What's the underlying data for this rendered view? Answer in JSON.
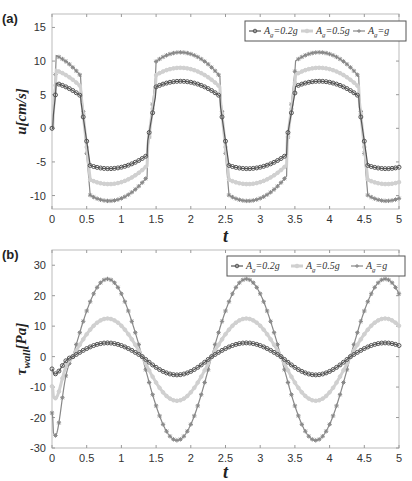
{
  "chart_data": [
    {
      "panel_label": "(a)",
      "type": "line",
      "title": "",
      "xlabel": "t",
      "ylabel": "u[cm/s]",
      "xlim": [
        0,
        5
      ],
      "ylim": [
        -12,
        17
      ],
      "xticks": [
        "0",
        "0.5",
        "1",
        "1.5",
        "2",
        "2.5",
        "3",
        "3.5",
        "4",
        "4.5",
        "5"
      ],
      "yticks": [
        "-10",
        "-5",
        "0",
        "5",
        "10",
        "15"
      ],
      "grid": false,
      "legend_position": "top-right",
      "series": [
        {
          "name": "A_g=0.2g",
          "legend_label": "=0.2g",
          "color": "#555555",
          "marker": "circle",
          "max": 7,
          "min": -6
        },
        {
          "name": "A_g=0.5g",
          "legend_label": "=0.5g",
          "color": "#d0d0d0",
          "marker": "circle",
          "max": 9,
          "min": -8.3
        },
        {
          "name": "A_g=g",
          "legend_label": "=g",
          "color": "#888888",
          "marker": "star",
          "max": 11.3,
          "min": -10.8
        }
      ],
      "period": 2,
      "description": "Square-ish periodic wave: rapid rise near t=0,2,4 and rapid drop near t=0.45,2.45,4.45; positive plateau arcs peaking ~t=0.1/1.8/3.8, negative arcs with minimum ~t=0.8/2.8/4.8"
    },
    {
      "panel_label": "(b)",
      "type": "line",
      "title": "",
      "xlabel": "t",
      "ylabel": "τ_wall[Pa]",
      "xlim": [
        0,
        5
      ],
      "ylim": [
        -30,
        35
      ],
      "xticks": [
        "0",
        "0.5",
        "1",
        "1.5",
        "2",
        "2.5",
        "3",
        "3.5",
        "4",
        "4.5",
        "5"
      ],
      "yticks": [
        "-30",
        "-20",
        "-10",
        "0",
        "10",
        "20",
        "30"
      ],
      "grid": false,
      "legend_position": "top-right",
      "series": [
        {
          "name": "A_g=0.2g",
          "legend_label": "=0.2g",
          "color": "#555555",
          "marker": "circle",
          "amplitude_pos": 4.5,
          "amplitude_neg": -6
        },
        {
          "name": "A_g=0.5g",
          "legend_label": "=0.5g",
          "color": "#d0d0d0",
          "marker": "circle",
          "amplitude_pos": 12.5,
          "amplitude_neg": -14.5
        },
        {
          "name": "A_g=g",
          "legend_label": "=g",
          "color": "#888888",
          "marker": "star",
          "amplitude_pos": 25.5,
          "amplitude_neg": -27.5
        }
      ],
      "period": 2,
      "description": "Sinusoidal: start near 0 with transient dip to ~-22 (A_g=g) at t≈0.05, peaks at t≈0.8/2.8/4.8, troughs at t≈1.85/3.85"
    }
  ],
  "legend": {
    "prefix": "A",
    "subscript": "g"
  }
}
